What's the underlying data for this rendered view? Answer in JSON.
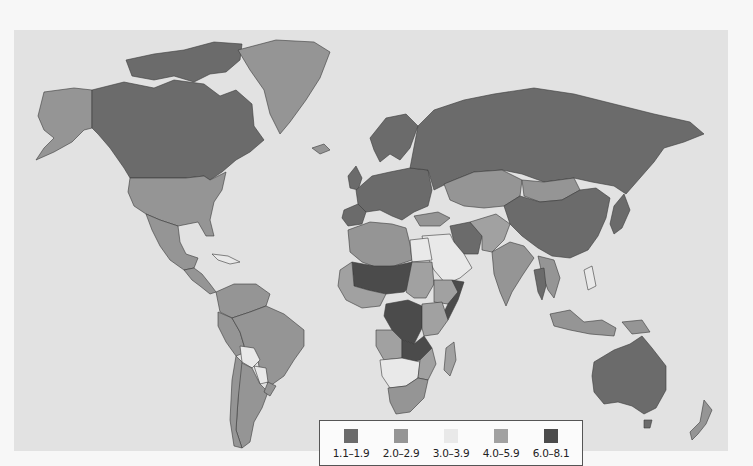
{
  "map": {
    "type": "choropleth",
    "background_color": "#e2e2e2",
    "legend": {
      "items": [
        {
          "label": "1.1–1.9",
          "color": "#6b6b6b"
        },
        {
          "label": "2.0–2.9",
          "color": "#959595"
        },
        {
          "label": "3.0–3.9",
          "color": "#e9e9e9"
        },
        {
          "label": "4.0–5.9",
          "color": "#a1a1a1"
        },
        {
          "label": "6.0–8.1",
          "color": "#4b4b4b"
        }
      ]
    },
    "regions": [
      {
        "name": "Canada",
        "class": 0
      },
      {
        "name": "Alaska (USA)",
        "class": 1
      },
      {
        "name": "Greenland",
        "class": 1
      },
      {
        "name": "United States",
        "class": 1
      },
      {
        "name": "Mexico",
        "class": 1
      },
      {
        "name": "Central America",
        "class": 1
      },
      {
        "name": "Caribbean",
        "class": 2
      },
      {
        "name": "Venezuela / Colombia",
        "class": 1
      },
      {
        "name": "Brazil",
        "class": 1
      },
      {
        "name": "Peru / Ecuador",
        "class": 1
      },
      {
        "name": "Bolivia",
        "class": 2
      },
      {
        "name": "Paraguay",
        "class": 2
      },
      {
        "name": "Argentina",
        "class": 1
      },
      {
        "name": "Chile",
        "class": 1
      },
      {
        "name": "Uruguay",
        "class": 1
      },
      {
        "name": "Europe",
        "class": 0
      },
      {
        "name": "Scandinavia",
        "class": 0
      },
      {
        "name": "Iceland",
        "class": 1
      },
      {
        "name": "Russia",
        "class": 0
      },
      {
        "name": "Kazakhstan / Central Asia",
        "class": 1
      },
      {
        "name": "Mongolia",
        "class": 1
      },
      {
        "name": "China",
        "class": 0
      },
      {
        "name": "Japan",
        "class": 0
      },
      {
        "name": "Turkey",
        "class": 1
      },
      {
        "name": "Iran",
        "class": 0
      },
      {
        "name": "Middle East / Arabia",
        "class": 2
      },
      {
        "name": "India",
        "class": 1
      },
      {
        "name": "Pakistan / Afghanistan",
        "class": 3
      },
      {
        "name": "Southeast Asia",
        "class": 1
      },
      {
        "name": "Thailand",
        "class": 0
      },
      {
        "name": "Indonesia",
        "class": 1
      },
      {
        "name": "Philippines",
        "class": 2
      },
      {
        "name": "Australia",
        "class": 0
      },
      {
        "name": "New Zealand",
        "class": 1
      },
      {
        "name": "North Africa (Algeria/Libya)",
        "class": 1
      },
      {
        "name": "Egypt",
        "class": 2
      },
      {
        "name": "Sahel (Mali/Niger/Chad)",
        "class": 4
      },
      {
        "name": "West Africa",
        "class": 3
      },
      {
        "name": "Sudan",
        "class": 3
      },
      {
        "name": "Ethiopia",
        "class": 3
      },
      {
        "name": "Somalia",
        "class": 4
      },
      {
        "name": "DR Congo",
        "class": 4
      },
      {
        "name": "Angola",
        "class": 3
      },
      {
        "name": "Zambia / Malawi",
        "class": 4
      },
      {
        "name": "East Africa",
        "class": 3
      },
      {
        "name": "Namibia / Botswana",
        "class": 2
      },
      {
        "name": "South Africa",
        "class": 1
      },
      {
        "name": "Madagascar",
        "class": 3
      }
    ]
  }
}
